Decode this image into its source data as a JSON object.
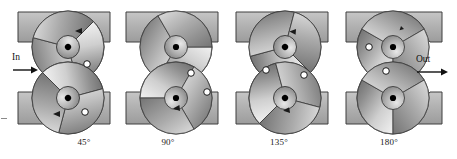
{
  "figure": {
    "type": "technical-illustration",
    "width": 457,
    "height": 159,
    "background_color": "#ffffff"
  },
  "flow": {
    "inlet": {
      "label": "In",
      "icon": "arrow-right-icon",
      "x": 14,
      "y": 55,
      "direction": "right"
    },
    "outlet": {
      "label": "Out",
      "icon": "arrow-right-icon",
      "x": 415,
      "y": 55,
      "direction": "right"
    }
  },
  "colors": {
    "housing_fill": "#a9a9a9",
    "housing_fill_light": "#c2c2c2",
    "housing_edge": "#4a4a4a",
    "rotor_light": "#efefef",
    "rotor_mid": "#b8b8b8",
    "rotor_dark": "#6e6e6e",
    "outline": "#2b2b2b",
    "hub_center": "#000000",
    "marker_ring": "#1a1a1a",
    "marker_fill": "#ffffff",
    "caption_text": "#1a1a1a",
    "arrow": "#111111"
  },
  "panels": [
    {
      "id": "panel-45",
      "caption": "45°",
      "angle_degrees": 45,
      "caption_x": 84,
      "origin_x": 4,
      "top_rotor": {
        "cx": 68,
        "cy": 47,
        "r": 36,
        "rotation": 45,
        "hub_r": 7.5
      },
      "bottom_rotor": {
        "cx": 68,
        "cy": 98,
        "r": 36,
        "rotation": -45,
        "hub_r": 7.5
      },
      "markers": [
        {
          "name": "timing-mark-top",
          "x": 85,
          "y": 65
        },
        {
          "name": "timing-mark-bottom",
          "x": 84,
          "y": 113
        }
      ],
      "housing_blocks": [
        {
          "name": "housing-block-upper",
          "x": 18,
          "y": 12,
          "w": 92,
          "h": 30
        },
        {
          "name": "housing-block-lower",
          "x": 18,
          "y": 92,
          "w": 92,
          "h": 32
        }
      ]
    },
    {
      "id": "panel-90",
      "caption": "90°",
      "angle_degrees": 90,
      "caption_x": 168,
      "origin_x": 117,
      "top_rotor": {
        "cx": 176,
        "cy": 47,
        "r": 36,
        "rotation": 90,
        "hub_r": 7.5
      },
      "bottom_rotor": {
        "cx": 176,
        "cy": 98,
        "r": 36,
        "rotation": -90,
        "hub_r": 7.5
      },
      "markers": [
        {
          "name": "timing-mark-top",
          "x": 190,
          "y": 74
        },
        {
          "name": "timing-mark-bottom",
          "x": 206,
          "y": 92
        }
      ],
      "housing_blocks": [
        {
          "name": "housing-block-upper",
          "x": 126,
          "y": 12,
          "w": 92,
          "h": 30
        },
        {
          "name": "housing-block-lower",
          "x": 126,
          "y": 92,
          "w": 92,
          "h": 32
        }
      ]
    },
    {
      "id": "panel-135",
      "caption": "135°",
      "angle_degrees": 135,
      "caption_x": 279,
      "origin_x": 227,
      "top_rotor": {
        "cx": 285,
        "cy": 47,
        "r": 36,
        "rotation": 135,
        "hub_r": 7.5
      },
      "bottom_rotor": {
        "cx": 285,
        "cy": 98,
        "r": 36,
        "rotation": -135,
        "hub_r": 7.5
      },
      "markers": [
        {
          "name": "timing-mark-top",
          "x": 266,
          "y": 70
        },
        {
          "name": "timing-mark-bottom",
          "x": 303,
          "y": 75
        }
      ],
      "housing_blocks": [
        {
          "name": "housing-block-upper",
          "x": 236,
          "y": 12,
          "w": 92,
          "h": 30
        },
        {
          "name": "housing-block-lower",
          "x": 236,
          "y": 92,
          "w": 92,
          "h": 32
        }
      ]
    },
    {
      "id": "panel-180",
      "caption": "180°",
      "angle_degrees": 180,
      "caption_x": 389,
      "origin_x": 338,
      "top_rotor": {
        "cx": 393,
        "cy": 47,
        "r": 36,
        "rotation": 180,
        "hub_r": 7.5
      },
      "bottom_rotor": {
        "cx": 393,
        "cy": 98,
        "r": 36,
        "rotation": -180,
        "hub_r": 7.5
      },
      "markers": [
        {
          "name": "timing-mark-top",
          "x": 369,
          "y": 47
        },
        {
          "name": "timing-mark-middle",
          "x": 385,
          "y": 72
        }
      ],
      "housing_blocks": [
        {
          "name": "housing-block-upper",
          "x": 346,
          "y": 12,
          "w": 96,
          "h": 30
        },
        {
          "name": "housing-block-lower",
          "x": 346,
          "y": 92,
          "w": 96,
          "h": 32
        }
      ]
    }
  ]
}
